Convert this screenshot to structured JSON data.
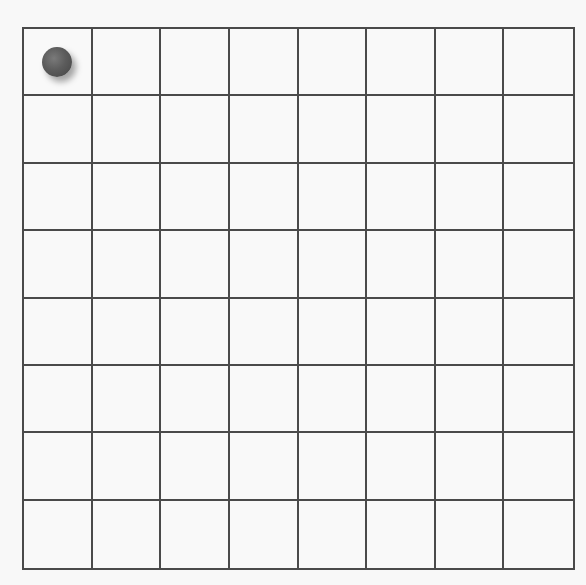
{
  "board": {
    "rows": 8,
    "cols": 8,
    "line_color": "#4a4a4a",
    "background": "#f9f9f9"
  },
  "pieces": [
    {
      "row": 0,
      "col": 0,
      "color": "#555555",
      "shape": "ball"
    }
  ]
}
